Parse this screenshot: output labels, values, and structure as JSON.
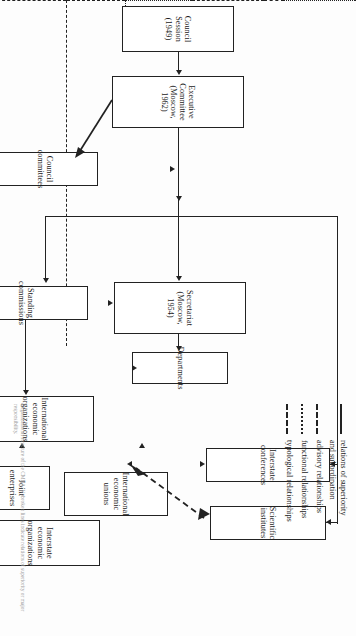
{
  "figure": {
    "kind": "organizational-chart",
    "orientation": "rotated-90-degrees"
  },
  "nodes": {
    "council_session": "Council Session\n(1949)",
    "executive_committee": "Executive Committee\n(Moscow, 1962)",
    "council_committees": "Council committees",
    "secretariat": "Secretariat\n(Moscow, 1954)",
    "standing_commissions": "Standing commissions",
    "departments": "Departments",
    "interstate_conferences": "Interstate conferences",
    "scientific_institutes": "Scientific institutes",
    "international_economic_organizations": "International economic\norganizations",
    "interstate_economic_organizations": "Interstate economic\norganizations",
    "international_economic_unions": "International\neconomic unions",
    "joint_enterprises": "Joint\nenterprises",
    "international_economic_partnerships": "International economic\npartnerships"
  },
  "legend": {
    "items": [
      {
        "style": "solid",
        "label": "relations of superiority\nand subordination"
      },
      {
        "style": "dashed",
        "label": "advisory relationships"
      },
      {
        "style": "dotted",
        "label": "functional relationships"
      },
      {
        "style": "dashdot",
        "label": "typological relationships"
      }
    ]
  },
  "caption": {
    "text": "Organizational structure of the CMEA. Unbroken lines indicate relations of superiority or major responsibility."
  },
  "colors": {
    "line": "#222222",
    "box_fill": "#ffffff",
    "page": "#fdfdfd",
    "caption": "#9a9a9a"
  }
}
